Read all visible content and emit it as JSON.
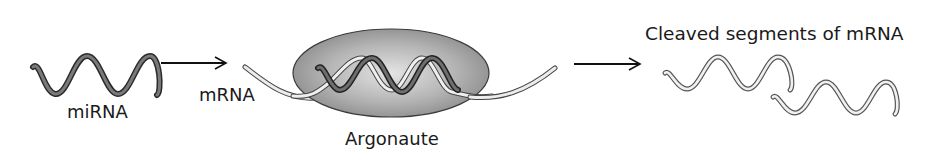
{
  "diagram": {
    "nodes": [
      {
        "id": "mirna",
        "label": "miRNA"
      },
      {
        "id": "mrna",
        "label": "mRNA"
      },
      {
        "id": "argonaute",
        "label": "Argonaute"
      },
      {
        "id": "cleaved",
        "label": "Cleaved segments of mRNA"
      }
    ],
    "edges": [
      {
        "from": "mirna",
        "to": "mrna"
      },
      {
        "from": "argonaute",
        "to": "cleaved"
      }
    ]
  },
  "labels": {
    "mirna": "miRNA",
    "mrna": "mRNA",
    "argonaute": "Argonaute",
    "cleaved": "Cleaved segments of mRNA"
  },
  "colors": {
    "argonaute_fill_center": "#dcdcdc",
    "argonaute_fill_edge": "#8a8a8a",
    "mirna_strand": "#4a4a4a",
    "mrna_strand": "#e6e6e6",
    "outline": "#333333",
    "arrow": "#111111"
  }
}
